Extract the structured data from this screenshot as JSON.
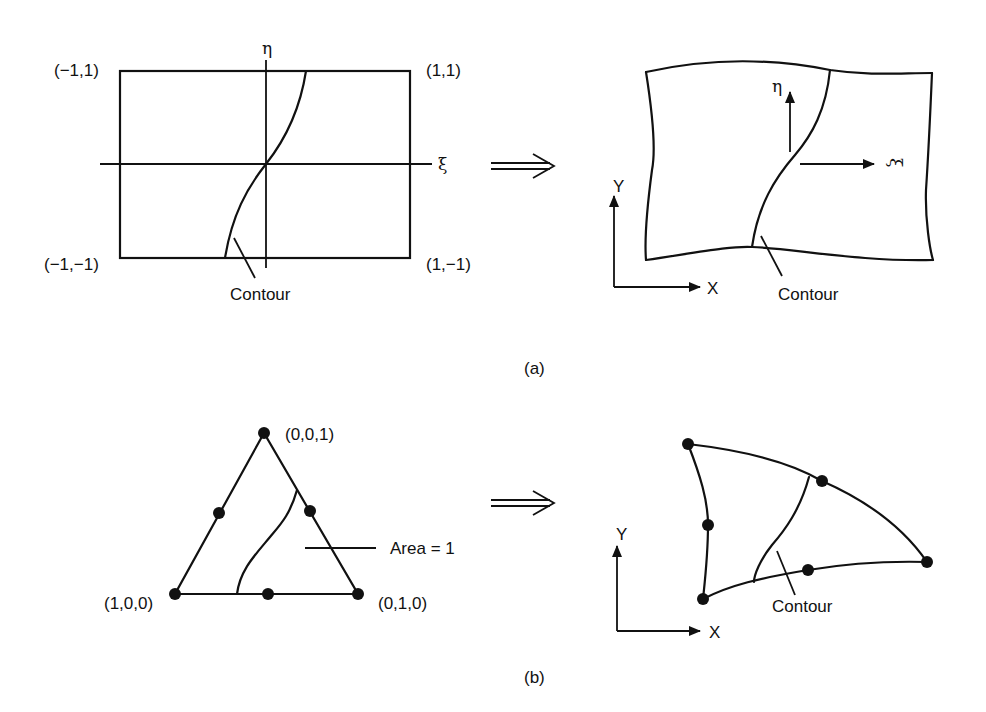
{
  "panel_a": {
    "caption": "(a)",
    "parent_element": {
      "corners": {
        "top_left": "(−1,1)",
        "top_right": "(1,1)",
        "bottom_left": "(−1,−1)",
        "bottom_right": "(1,−1)"
      },
      "axis_xi": "ξ",
      "axis_eta": "η",
      "contour_label": "Contour"
    },
    "mapping_arrow": "⇒",
    "mapped_element": {
      "local_axis_eta": "η",
      "local_axis_xi": "ξ",
      "global_axis_x": "X",
      "global_axis_y": "Y",
      "contour_label": "Contour"
    }
  },
  "panel_b": {
    "caption": "(b)",
    "parent_element": {
      "vertices": {
        "top": "(0,0,1)",
        "bottom_left": "(1,0,0)",
        "bottom_right": "(0,1,0)"
      },
      "area_label": "Area = 1"
    },
    "mapping_arrow": "⇒",
    "mapped_element": {
      "global_axis_x": "X",
      "global_axis_y": "Y",
      "contour_label": "Contour"
    }
  }
}
